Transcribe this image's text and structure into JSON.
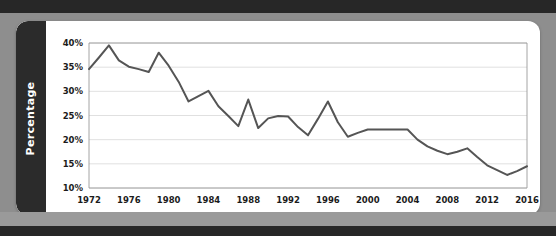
{
  "page": {
    "background_color": "#8e8e8e",
    "band_color": "#272727"
  },
  "card": {
    "background_color": "#ffffff",
    "side_label_bar_color": "#2b2b2b"
  },
  "axis_label": {
    "text": "Percentage"
  },
  "chart_data": {
    "type": "line",
    "title": "",
    "subtitle": "",
    "xlabel": "",
    "ylabel": "Percentage",
    "xlim": [
      1972,
      2016
    ],
    "ylim": [
      10,
      40
    ],
    "grid": true,
    "legend": false,
    "legend_position": "none",
    "line_color": "#555555",
    "ytick_labels": [
      "40%",
      "35%",
      "30%",
      "25%",
      "20%",
      "15%",
      "10%"
    ],
    "ytick_values": [
      40,
      35,
      30,
      25,
      20,
      15,
      10
    ],
    "xtick_labels": [
      "1972",
      "1976",
      "1980",
      "1984",
      "1988",
      "1992",
      "1996",
      "2000",
      "2004",
      "2008",
      "2012",
      "2016"
    ],
    "xtick_values": [
      1972,
      1976,
      1980,
      1984,
      1988,
      1992,
      1996,
      2000,
      2004,
      2008,
      2012,
      2016
    ],
    "x": [
      1972,
      1973,
      1974,
      1975,
      1976,
      1977,
      1978,
      1979,
      1980,
      1981,
      1982,
      1983,
      1984,
      1985,
      1986,
      1987,
      1988,
      1989,
      1990,
      1991,
      1992,
      1993,
      1994,
      1995,
      1996,
      1997,
      1998,
      1999,
      2000,
      2001,
      2002,
      2003,
      2004,
      2005,
      2006,
      2007,
      2008,
      2009,
      2010,
      2011,
      2012,
      2013,
      2014,
      2015,
      2016
    ],
    "values": [
      34.6,
      37.0,
      39.5,
      36.4,
      35.1,
      34.6,
      34.0,
      38.0,
      35.3,
      32.0,
      27.9,
      29.0,
      30.1,
      26.9,
      24.9,
      22.8,
      28.3,
      22.4,
      24.4,
      24.9,
      24.8,
      22.6,
      20.9,
      24.3,
      27.9,
      23.6,
      20.6,
      21.4,
      22.1,
      22.1,
      22.1,
      22.1,
      22.1,
      20.0,
      18.6,
      17.7,
      17.0,
      17.5,
      18.2,
      16.4,
      14.7,
      13.7,
      12.7,
      13.5,
      14.5
    ],
    "series": [
      {
        "name": "Percentage",
        "values": [
          34.6,
          37.0,
          39.5,
          36.4,
          35.1,
          34.6,
          34.0,
          38.0,
          35.3,
          32.0,
          27.9,
          29.0,
          30.1,
          26.9,
          24.9,
          22.8,
          28.3,
          22.4,
          24.4,
          24.9,
          24.8,
          22.6,
          20.9,
          24.3,
          27.9,
          23.6,
          20.6,
          21.4,
          22.1,
          22.1,
          22.1,
          22.1,
          22.1,
          20.0,
          18.6,
          17.7,
          17.0,
          17.5,
          18.2,
          16.4,
          14.7,
          13.7,
          12.7,
          13.5,
          14.5
        ]
      }
    ]
  }
}
